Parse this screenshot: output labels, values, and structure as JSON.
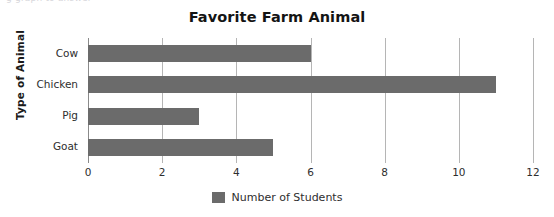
{
  "clipped_top_text": "g graph to answer",
  "chart_data": {
    "type": "bar",
    "orientation": "horizontal",
    "title": "Favorite Farm Animal",
    "xlabel": "",
    "ylabel": "Type of Animal",
    "categories": [
      "Cow",
      "Chicken",
      "Pig",
      "Goat"
    ],
    "values": [
      6,
      11,
      3,
      5
    ],
    "series": [
      {
        "name": "Number of Students",
        "values": [
          6,
          11,
          3,
          5
        ],
        "color": "#6b6b6b"
      }
    ],
    "xlim": [
      0,
      12
    ],
    "xticks": [
      0,
      2,
      4,
      6,
      8,
      10,
      12
    ],
    "xtick_labels": [
      "0",
      "2",
      "4",
      "6",
      "8",
      "10",
      "12"
    ],
    "grid": "vertical",
    "legend": {
      "position": "bottom",
      "entries": [
        {
          "label": "Number of Students",
          "color": "#6b6b6b"
        }
      ]
    }
  }
}
